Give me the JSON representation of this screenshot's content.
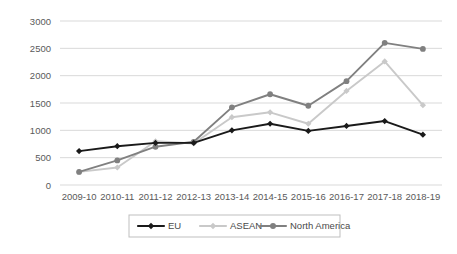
{
  "chart_data": {
    "type": "line",
    "title": "",
    "xlabel": "",
    "ylabel": "",
    "categories": [
      "2009-10",
      "2010-11",
      "2011-12",
      "2012-13",
      "2013-14",
      "2014-15",
      "2015-16",
      "2016-17",
      "2017-18",
      "2018-19"
    ],
    "ylim": [
      0,
      3000
    ],
    "yticks": [
      0,
      500,
      1000,
      1500,
      2000,
      2500,
      3000
    ],
    "ytick_labels": [
      "0",
      "500",
      "1000",
      "1500",
      "2000",
      "2500",
      "3000"
    ],
    "grid": true,
    "legend_position": "bottom",
    "series": [
      {
        "name": "EU",
        "color": "#1a1a1a",
        "marker": "diamond",
        "values": [
          620,
          710,
          770,
          770,
          1000,
          1120,
          990,
          1080,
          1170,
          920
        ]
      },
      {
        "name": "ASEAN",
        "color": "#c9c9c9",
        "marker": "diamond",
        "values": [
          240,
          320,
          800,
          760,
          1240,
          1330,
          1120,
          1720,
          2260,
          1460
        ]
      },
      {
        "name": "North America",
        "color": "#808080",
        "marker": "circle",
        "values": [
          240,
          450,
          700,
          790,
          1420,
          1660,
          1450,
          1900,
          2600,
          2490
        ]
      }
    ]
  },
  "legend": {
    "items": [
      {
        "label": "EU"
      },
      {
        "label": "ASEAN"
      },
      {
        "label": "North America"
      }
    ]
  }
}
